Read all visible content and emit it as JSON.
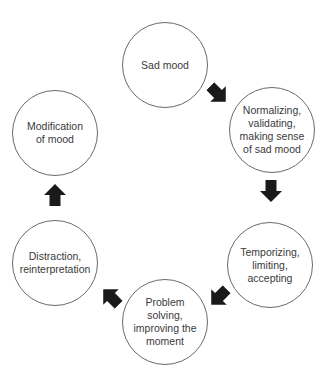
{
  "diagram": {
    "type": "cycle",
    "header_partial": "",
    "colors": {
      "circle_stroke": "#6a6a6a",
      "arrow_fill": "#1a1a1a",
      "text": "#3a3a3a"
    },
    "nodes": [
      {
        "id": "sad-mood",
        "label": "Sad mood"
      },
      {
        "id": "normalizing",
        "label": "Normalizing,\nvalidating,\nmaking sense\nof sad mood"
      },
      {
        "id": "temporizing",
        "label": "Temporizing,\nlimiting,\naccepting"
      },
      {
        "id": "problem-solving",
        "label": "Problem\nsolving,\nimproving the\nmoment"
      },
      {
        "id": "distraction",
        "label": "Distraction,\nreinterpretation"
      },
      {
        "id": "modification",
        "label": "Modification\nof mood"
      }
    ],
    "edges": [
      {
        "from": "sad-mood",
        "to": "normalizing",
        "icon": "arrow-down-right-icon"
      },
      {
        "from": "normalizing",
        "to": "temporizing",
        "icon": "arrow-down-icon"
      },
      {
        "from": "temporizing",
        "to": "problem-solving",
        "icon": "arrow-down-left-icon"
      },
      {
        "from": "problem-solving",
        "to": "distraction",
        "icon": "arrow-up-left-icon"
      },
      {
        "from": "distraction",
        "to": "modification",
        "icon": "arrow-up-icon"
      }
    ]
  }
}
